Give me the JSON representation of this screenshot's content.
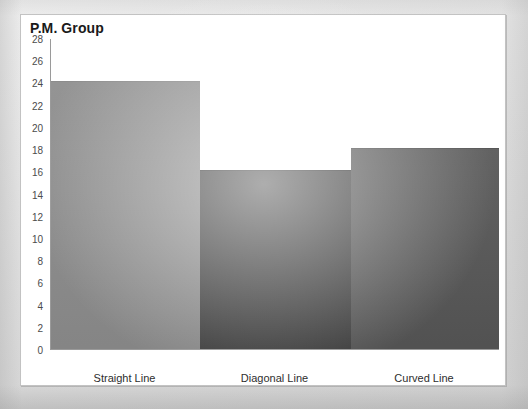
{
  "panel": {
    "background_color": "#ffffff",
    "border_color": "#c3c3c3"
  },
  "page": {
    "background_color": "#d9d9d9"
  },
  "chart_data": {
    "type": "bar",
    "title": "P.M. Group",
    "subtitle": "",
    "xlabel": "",
    "ylabel": "",
    "categories": [
      "Straight Line",
      "Diagonal Line",
      "Curved Line"
    ],
    "values": [
      24,
      16,
      18
    ],
    "series": [
      {
        "name": "P.M. Group",
        "values": [
          24,
          16,
          18
        ]
      }
    ],
    "bar_colors": [
      "#8c8c8c",
      "#3f3f3f",
      "#565656"
    ],
    "ylim": [
      0,
      28
    ],
    "ytick_step": 2,
    "yticks": [
      28,
      26,
      24,
      22,
      20,
      18,
      16,
      14,
      12,
      10,
      8,
      6,
      4,
      2,
      0
    ],
    "ytick_labels": [
      "28",
      "26",
      "24",
      "22",
      "20",
      "18",
      "16",
      "14",
      "12",
      "10",
      "8",
      "6",
      "4",
      "2",
      "0"
    ],
    "grid": false,
    "legend": false,
    "legend_position": "none",
    "axis_line_color": "#9a9a9a",
    "annotations": []
  }
}
